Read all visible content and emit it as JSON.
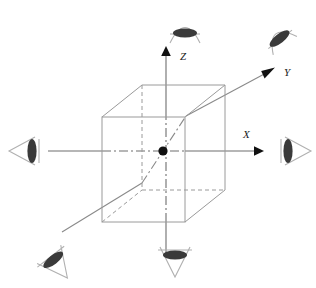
{
  "figure": {
    "background_color": "#ffffff",
    "width": 316,
    "height": 288
  },
  "colors": {
    "cube_edge": "#9a9a9a",
    "cube_hidden_edge": "#9a9a9a",
    "axis_line": "#6e6e6e",
    "axis_arrow": "#111111",
    "origin_dot": "#111111",
    "eye_pupil": "#3a3a3a",
    "eye_cone": "#b0b0b0",
    "label_text": "#1a1a1a"
  },
  "axes": [
    {
      "id": "x",
      "label": "X",
      "direction": "right",
      "tip": {
        "x": 262,
        "y": 151
      },
      "label_pos": {
        "x": 243,
        "y": 138
      }
    },
    {
      "id": "y",
      "label": "Y",
      "direction": "up-right-diagonal",
      "tip": {
        "x": 277,
        "y": 66
      },
      "label_pos": {
        "x": 284,
        "y": 76
      }
    },
    {
      "id": "z",
      "label": "Z",
      "direction": "up",
      "tip": {
        "x": 172,
        "y": 48
      },
      "label_pos": {
        "x": 180,
        "y": 60
      }
    }
  ],
  "origin": {
    "label": "origin",
    "x": 163,
    "y": 151,
    "radius": 4.6
  },
  "cube": {
    "label": "wireframe cube",
    "front_face": {
      "left": 102,
      "top": 117,
      "right": 185,
      "bottom": 222
    },
    "depth_offset": {
      "dx": 40,
      "dy": -32
    },
    "visible_edge_style": "solid",
    "hidden_edge_style": "dashed"
  },
  "eyes": [
    {
      "id": "top",
      "name": "eye-top",
      "label": "eye viewing from +Z",
      "x": 185,
      "y": 28,
      "rotation": 0,
      "pupil_rx": 12,
      "pupil_ry": 4.5,
      "cone_dir": "up"
    },
    {
      "id": "bottom",
      "name": "eye-bottom",
      "label": "eye viewing from -Z",
      "x": 175,
      "y": 258,
      "rotation": 0,
      "pupil_rx": 12,
      "pupil_ry": 4.5,
      "cone_dir": "down"
    },
    {
      "id": "right",
      "name": "eye-right",
      "label": "eye viewing from +X",
      "x": 292,
      "y": 151,
      "rotation": 90,
      "pupil_rx": 12,
      "pupil_ry": 4.5,
      "cone_dir": "right"
    },
    {
      "id": "left",
      "name": "eye-left",
      "label": "eye viewing from -X",
      "x": 28,
      "y": 151,
      "rotation": 90,
      "pupil_rx": 12,
      "pupil_ry": 4.5,
      "cone_dir": "left"
    },
    {
      "id": "upper-right",
      "name": "eye-upper-right",
      "label": "eye viewing from +Y",
      "x": 290,
      "y": 52,
      "rotation": -38,
      "pupil_rx": 12,
      "pupil_ry": 4.5,
      "cone_dir": "upper-right"
    },
    {
      "id": "lower-left",
      "name": "eye-lower-left",
      "label": "eye viewing from -Y",
      "x": 44,
      "y": 248,
      "rotation": -38,
      "pupil_rx": 12,
      "pupil_ry": 4.5,
      "cone_dir": "lower-left"
    }
  ]
}
